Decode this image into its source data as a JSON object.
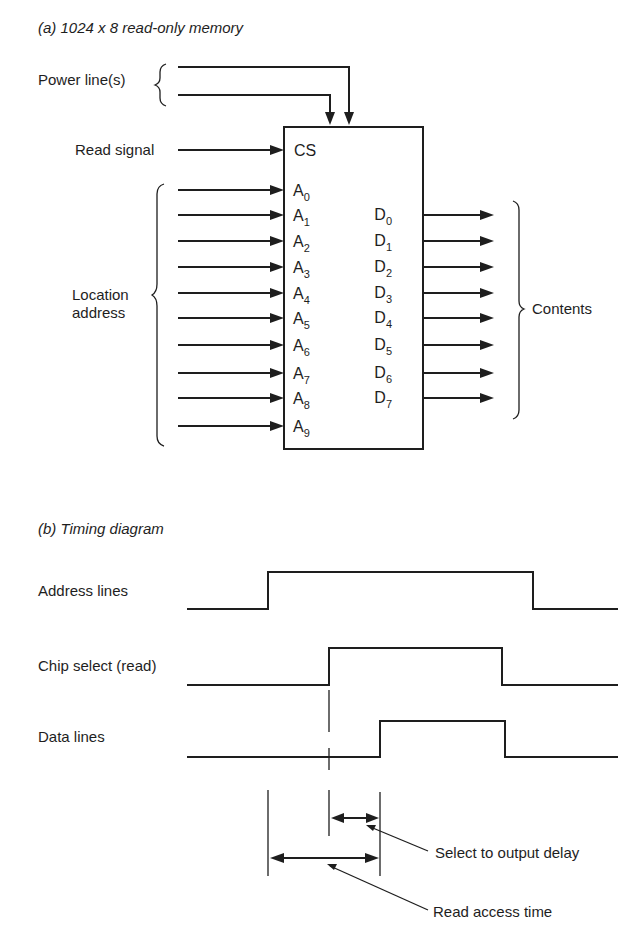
{
  "part_a": {
    "title": "(a) 1024 x 8 read-only memory",
    "power_label": "Power line(s)",
    "read_label": "Read signal",
    "chip_select_pin": "CS",
    "address_group_label_line1": "Location",
    "address_group_label_line2": "address",
    "contents_label": "Contents",
    "address_pins": [
      {
        "base": "A",
        "sub": "0"
      },
      {
        "base": "A",
        "sub": "1"
      },
      {
        "base": "A",
        "sub": "2"
      },
      {
        "base": "A",
        "sub": "3"
      },
      {
        "base": "A",
        "sub": "4"
      },
      {
        "base": "A",
        "sub": "5"
      },
      {
        "base": "A",
        "sub": "6"
      },
      {
        "base": "A",
        "sub": "7"
      },
      {
        "base": "A",
        "sub": "8"
      },
      {
        "base": "A",
        "sub": "9"
      }
    ],
    "data_pins": [
      {
        "base": "D",
        "sub": "0"
      },
      {
        "base": "D",
        "sub": "1"
      },
      {
        "base": "D",
        "sub": "2"
      },
      {
        "base": "D",
        "sub": "3"
      },
      {
        "base": "D",
        "sub": "4"
      },
      {
        "base": "D",
        "sub": "5"
      },
      {
        "base": "D",
        "sub": "6"
      },
      {
        "base": "D",
        "sub": "7"
      }
    ]
  },
  "part_b": {
    "title": "(b) Timing diagram",
    "signals": [
      {
        "label": "Address lines"
      },
      {
        "label": "Chip select (read)"
      },
      {
        "label": "Data lines"
      }
    ],
    "annotations": {
      "select_delay": "Select to output delay",
      "read_access": "Read access time"
    }
  }
}
